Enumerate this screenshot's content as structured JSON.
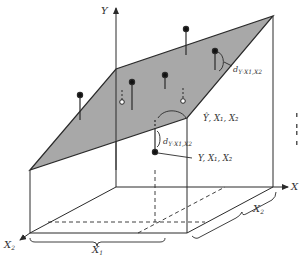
{
  "figure": {
    "axes": {
      "y_label": "Y",
      "x_label": "X",
      "x1_label": "X",
      "x1_sub": "1",
      "x2_label": "X",
      "x2_sub": "2",
      "x2_axis_label": "X",
      "x2_axis_sub": "2"
    },
    "annotations": {
      "deviation_top": {
        "main": "d",
        "sub": "Y·X1,X2"
      },
      "deviation_mid": {
        "main": "d",
        "sub": "Y·X1,X2"
      },
      "predicted_point": "Ŷ, X₁, X₂",
      "observed_point": "Y, X₁, X₂"
    },
    "colors": {
      "plane_fill": "#a8a8a8",
      "line": "#2a2a2a",
      "background": "#ffffff"
    }
  }
}
